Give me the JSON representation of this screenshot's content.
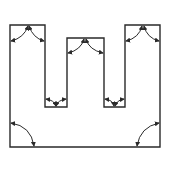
{
  "diagram": {
    "title": "",
    "stroke_color": "#2a2a2a",
    "background_color": "#ffffff",
    "columns": [
      {
        "id": "left-column",
        "corner_arrows": "top-peak-pair"
      },
      {
        "id": "middle-column",
        "corner_arrows": "top-peak-pair"
      },
      {
        "id": "right-column",
        "corner_arrows": "top-peak-pair"
      }
    ],
    "notches": [
      {
        "id": "left-notch",
        "corner_arrows": "bottom-valley-pair"
      },
      {
        "id": "right-notch",
        "corner_arrows": "bottom-valley-pair"
      }
    ],
    "bottom_corners": [
      {
        "id": "bottom-left-corner",
        "corner_arrows": "single-arc"
      },
      {
        "id": "bottom-right-corner",
        "corner_arrows": "single-arc"
      }
    ]
  }
}
